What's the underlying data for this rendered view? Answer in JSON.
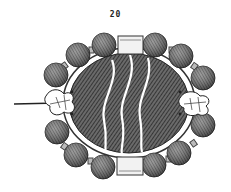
{
  "figure": {
    "number_label": "20",
    "colors": {
      "background": "#ffffff",
      "ink": "#2a2a2a",
      "bead": "#555555",
      "stone": "#4a4a4a",
      "highlight": "#ffffff"
    }
  }
}
